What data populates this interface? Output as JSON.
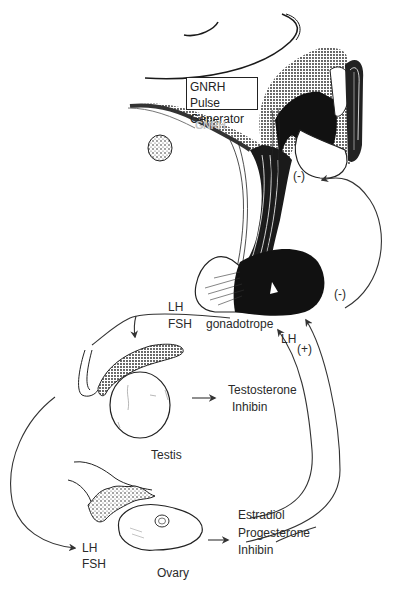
{
  "diagram": {
    "type": "hypothalamic-pituitary-gonadal axis",
    "style": "black and white line illustration",
    "colors": {
      "ink": "#1a1a1a",
      "background": "#ffffff",
      "faint_text": "#c4c4c4"
    }
  },
  "labels": {
    "pulse_generator_line1": "GNRH Pulse",
    "pulse_generator_line2": "Generator",
    "gnrh": "GNRH",
    "neg_feedback_upper": "(-)",
    "neg_feedback_lower": "(-)",
    "pituitary_lh": "LH",
    "pituitary_fsh": "FSH",
    "gonadotrope": "gonadotrope",
    "lh_surge": "LH",
    "pos_feedback": "(+)",
    "testis_output_1": "Testosterone",
    "testis_output_2": "Inhibin",
    "testis": "Testis",
    "ovary_lh": "LH",
    "ovary_fsh": "FSH",
    "ovary": "Ovary",
    "ovary_output_1": "Estradiol",
    "ovary_output_2": "Progesterone",
    "ovary_output_3": "Inhibin"
  }
}
